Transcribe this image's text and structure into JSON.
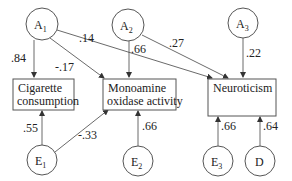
{
  "diagram": {
    "type": "path-diagram",
    "latent_nodes": [
      {
        "id": "A1",
        "label": "A",
        "sub": "1"
      },
      {
        "id": "A2",
        "label": "A",
        "sub": "2"
      },
      {
        "id": "A3",
        "label": "A",
        "sub": "3"
      },
      {
        "id": "E1",
        "label": "E",
        "sub": "1"
      },
      {
        "id": "E2",
        "label": "E",
        "sub": "2"
      },
      {
        "id": "E3",
        "label": "E",
        "sub": "3"
      },
      {
        "id": "D",
        "label": "D",
        "sub": ""
      }
    ],
    "observed_nodes": [
      {
        "id": "cig",
        "line1": "Cigarette",
        "line2": "consumption"
      },
      {
        "id": "mao",
        "line1": "Monoamine",
        "line2": "oxidase activity"
      },
      {
        "id": "neu",
        "line1": "Neuroticism",
        "line2": ""
      }
    ],
    "edges": [
      {
        "from": "A1",
        "to": "cig",
        "weight": ".84"
      },
      {
        "from": "A1",
        "to": "mao",
        "weight": "-.17"
      },
      {
        "from": "A1",
        "to": "neu",
        "weight": ".14"
      },
      {
        "from": "A2",
        "to": "mao",
        "weight": ".66"
      },
      {
        "from": "A2",
        "to": "neu",
        "weight": ".27"
      },
      {
        "from": "A3",
        "to": "neu",
        "weight": ".22"
      },
      {
        "from": "E1",
        "to": "cig",
        "weight": ".55"
      },
      {
        "from": "E1",
        "to": "mao",
        "weight": "-.33"
      },
      {
        "from": "E2",
        "to": "mao",
        "weight": ".66"
      },
      {
        "from": "E3",
        "to": "neu",
        "weight": ".66"
      },
      {
        "from": "D",
        "to": "neu",
        "weight": ".64"
      }
    ]
  }
}
